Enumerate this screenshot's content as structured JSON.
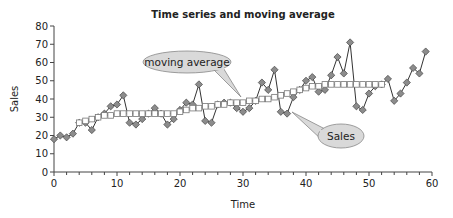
{
  "chart_data": {
    "type": "line",
    "title": "Time series and moving average",
    "xlabel": "Time",
    "ylabel": "Sales",
    "xlim": [
      0,
      60
    ],
    "ylim": [
      0,
      80
    ],
    "x_ticks": [
      0,
      10,
      20,
      30,
      40,
      50,
      60
    ],
    "x_minor_tick_step": 2,
    "y_ticks": [
      0,
      10,
      20,
      30,
      40,
      50,
      60,
      70,
      80
    ],
    "grid": false,
    "legend": "callouts",
    "series": [
      {
        "name": "Sales",
        "marker": "diamond",
        "color": "#8c8c8c",
        "x": [
          0,
          1,
          2,
          3,
          4,
          5,
          6,
          7,
          8,
          9,
          10,
          11,
          12,
          13,
          14,
          15,
          16,
          17,
          18,
          19,
          20,
          21,
          22,
          23,
          24,
          25,
          26,
          27,
          28,
          29,
          30,
          31,
          32,
          33,
          34,
          35,
          36,
          37,
          38,
          39,
          40,
          41,
          42,
          43,
          44,
          45,
          46,
          47,
          48,
          49,
          50,
          51,
          52,
          53,
          54,
          55,
          56,
          57,
          58,
          59
        ],
        "values": [
          18,
          20,
          19,
          21,
          27,
          27,
          23,
          30,
          32,
          36,
          37,
          42,
          27,
          26,
          29,
          32,
          35,
          32,
          26,
          29,
          34,
          38,
          37,
          48,
          28,
          27,
          37,
          38,
          38,
          35,
          33,
          35,
          39,
          49,
          45,
          56,
          33,
          32,
          41,
          45,
          50,
          52,
          44,
          45,
          53,
          63,
          54,
          71,
          36,
          34,
          43,
          47,
          48,
          51,
          39,
          43,
          49,
          57,
          54,
          66
        ]
      },
      {
        "name": "moving average",
        "marker": "square",
        "color": "#ffffff",
        "x": [
          4,
          5,
          6,
          7,
          8,
          9,
          10,
          11,
          12,
          13,
          14,
          15,
          16,
          17,
          18,
          19,
          20,
          21,
          22,
          23,
          24,
          25,
          26,
          27,
          28,
          29,
          30,
          31,
          32,
          33,
          34,
          35,
          36,
          37,
          38,
          39,
          40,
          41,
          42,
          43,
          44,
          45,
          46,
          47,
          48,
          49,
          50,
          51,
          52
        ],
        "values": [
          27,
          28,
          29,
          30,
          31,
          31,
          32,
          32,
          32,
          32,
          32,
          32,
          32,
          32,
          32,
          32,
          33,
          34,
          35,
          35,
          36,
          36,
          37,
          37,
          38,
          38,
          38,
          39,
          39,
          40,
          40,
          41,
          42,
          43,
          44,
          45,
          46,
          47,
          47,
          48,
          48,
          48,
          48,
          48,
          48,
          48,
          48,
          48,
          48
        ]
      }
    ],
    "annotations": [
      {
        "text": "moving average",
        "target_series": "moving average"
      },
      {
        "text": "Sales",
        "target_series": "Sales"
      }
    ]
  }
}
